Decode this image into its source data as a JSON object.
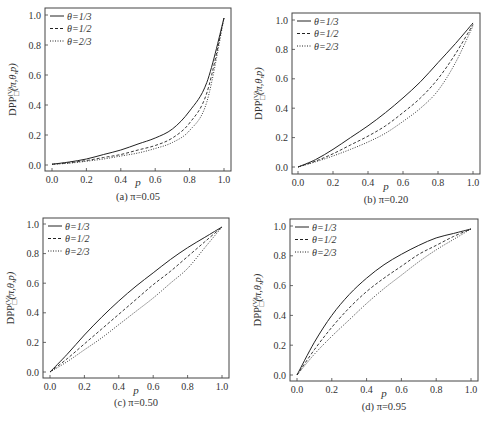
{
  "figure": {
    "y_axis_label": "DPP",
    "y_axis_label_sup": "(V)",
    "y_axis_label_sub": "□",
    "y_axis_label_args": "(π,θ,p)",
    "x_axis_label": "p",
    "legend": [
      "θ=1/3",
      "θ=1/2",
      "θ=2/3"
    ],
    "x_ticks": [
      "0.0",
      "0.2",
      "0.4",
      "0.6",
      "0.8",
      "1.0"
    ],
    "y_ticks": [
      "0.0",
      "0.2",
      "0.4",
      "0.6",
      "0.8",
      "1.0"
    ],
    "line_color": "#222222"
  },
  "chart_data": [
    {
      "type": "line",
      "panel": "a",
      "title": "(a) π=0.05",
      "xlabel": "p",
      "ylabel": "DPP□(V)(π,θ,p)",
      "xlim": [
        0,
        1
      ],
      "ylim": [
        0,
        1
      ],
      "x": [
        0,
        0.1,
        0.2,
        0.3,
        0.4,
        0.5,
        0.6,
        0.7,
        0.8,
        0.9,
        1.0
      ],
      "series": [
        {
          "name": "θ=1/3",
          "style": "solid",
          "values": [
            0.005,
            0.02,
            0.04,
            0.07,
            0.1,
            0.14,
            0.18,
            0.24,
            0.36,
            0.55,
            0.98
          ]
        },
        {
          "name": "θ=1/2",
          "style": "dashed",
          "values": [
            0.005,
            0.015,
            0.03,
            0.05,
            0.07,
            0.1,
            0.13,
            0.18,
            0.28,
            0.48,
            0.98
          ]
        },
        {
          "name": "θ=2/3",
          "style": "dotted",
          "values": [
            0.005,
            0.012,
            0.025,
            0.04,
            0.06,
            0.08,
            0.11,
            0.15,
            0.23,
            0.42,
            0.98
          ]
        }
      ],
      "legend_position": "upper left",
      "grid": false
    },
    {
      "type": "line",
      "panel": "b",
      "title": "(b) π=0.20",
      "xlabel": "p",
      "ylabel": "DPP□(V)(π,θ,p)",
      "xlim": [
        0,
        1
      ],
      "ylim": [
        0,
        1
      ],
      "x": [
        0,
        0.1,
        0.2,
        0.3,
        0.4,
        0.5,
        0.6,
        0.7,
        0.8,
        0.9,
        1.0
      ],
      "series": [
        {
          "name": "θ=1/3",
          "style": "solid",
          "values": [
            0,
            0.05,
            0.12,
            0.2,
            0.28,
            0.37,
            0.47,
            0.58,
            0.71,
            0.84,
            0.98
          ]
        },
        {
          "name": "θ=1/2",
          "style": "dashed",
          "values": [
            0,
            0.04,
            0.09,
            0.15,
            0.21,
            0.28,
            0.37,
            0.47,
            0.6,
            0.77,
            0.97
          ]
        },
        {
          "name": "θ=2/3",
          "style": "dotted",
          "values": [
            0,
            0.035,
            0.075,
            0.12,
            0.17,
            0.23,
            0.31,
            0.4,
            0.52,
            0.71,
            0.96
          ]
        }
      ],
      "legend_position": "upper left",
      "grid": false
    },
    {
      "type": "line",
      "panel": "c",
      "title": "(c) π=0.50",
      "xlabel": "p",
      "ylabel": "DPP□(V)(π,θ,p)",
      "xlim": [
        0,
        1
      ],
      "ylim": [
        0,
        1
      ],
      "x": [
        0,
        0.1,
        0.2,
        0.3,
        0.4,
        0.5,
        0.6,
        0.7,
        0.8,
        0.9,
        1.0
      ],
      "series": [
        {
          "name": "θ=1/3",
          "style": "solid",
          "values": [
            0,
            0.12,
            0.25,
            0.37,
            0.48,
            0.58,
            0.67,
            0.76,
            0.84,
            0.91,
            0.98
          ]
        },
        {
          "name": "θ=1/2",
          "style": "dashed",
          "values": [
            0,
            0.09,
            0.19,
            0.29,
            0.39,
            0.49,
            0.59,
            0.68,
            0.78,
            0.88,
            0.98
          ]
        },
        {
          "name": "θ=2/3",
          "style": "dotted",
          "values": [
            0,
            0.07,
            0.15,
            0.23,
            0.32,
            0.41,
            0.5,
            0.6,
            0.7,
            0.84,
            0.98
          ]
        }
      ],
      "legend_position": "upper left",
      "grid": false
    },
    {
      "type": "line",
      "panel": "d",
      "title": "(d) π=0.95",
      "xlabel": "p",
      "ylabel": "DPP□(V)(π,θ,p)",
      "xlim": [
        0,
        1
      ],
      "ylim": [
        0,
        1
      ],
      "x": [
        0,
        0.1,
        0.2,
        0.3,
        0.4,
        0.5,
        0.6,
        0.7,
        0.8,
        0.9,
        1.0
      ],
      "series": [
        {
          "name": "θ=1/3",
          "style": "solid",
          "values": [
            0,
            0.22,
            0.4,
            0.54,
            0.65,
            0.74,
            0.81,
            0.87,
            0.92,
            0.95,
            0.98
          ]
        },
        {
          "name": "θ=1/2",
          "style": "dashed",
          "values": [
            0,
            0.17,
            0.32,
            0.45,
            0.56,
            0.65,
            0.73,
            0.81,
            0.87,
            0.93,
            0.98
          ]
        },
        {
          "name": "θ=2/3",
          "style": "dotted",
          "values": [
            0,
            0.14,
            0.26,
            0.37,
            0.48,
            0.58,
            0.67,
            0.76,
            0.84,
            0.91,
            0.98
          ]
        }
      ],
      "legend_position": "upper left",
      "grid": false
    }
  ]
}
